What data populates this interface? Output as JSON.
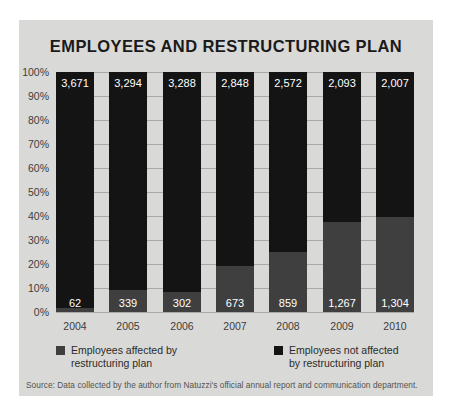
{
  "chart_data": {
    "type": "bar",
    "subtype": "stacked-percent",
    "title": "EMPLOYEES AND RESTRUCTURING PLAN",
    "xlabel": "",
    "ylabel": "",
    "ylim": [
      0,
      100
    ],
    "grid": true,
    "legend_position": "bottom",
    "categories": [
      "2004",
      "2005",
      "2006",
      "2007",
      "2008",
      "2009",
      "2010"
    ],
    "ytick_labels": [
      "100%",
      "90%",
      "80%",
      "70%",
      "60%",
      "50%",
      "40%",
      "30%",
      "20%",
      "10%",
      "0%"
    ],
    "ytick_values": [
      100,
      90,
      80,
      70,
      60,
      50,
      40,
      30,
      20,
      10,
      0
    ],
    "series": [
      {
        "name": "Employees not affected by restructuring plan",
        "color": "#141414",
        "values": [
          3671,
          3294,
          3288,
          2848,
          2572,
          2093,
          2007
        ],
        "labels": [
          "3,671",
          "3,294",
          "3,288",
          "2,848",
          "2,572",
          "2,093",
          "2,007"
        ],
        "percents": [
          98.3,
          90.7,
          91.6,
          80.9,
          75.0,
          62.3,
          60.6
        ]
      },
      {
        "name": "Employees affected by restructuring plan",
        "color": "#3f3f3f",
        "values": [
          62,
          339,
          302,
          673,
          859,
          1267,
          1304
        ],
        "labels": [
          "62",
          "339",
          "302",
          "673",
          "859",
          "1,267",
          "1,304"
        ],
        "percents": [
          1.7,
          9.3,
          8.4,
          19.1,
          25.0,
          37.7,
          39.4
        ]
      }
    ],
    "annotations": []
  },
  "legend": {
    "items": [
      {
        "label": "Employees affected by restructuring plan",
        "color": "#3f3f3f"
      },
      {
        "label": "Employees not affected by restructuring plan",
        "color": "#141414"
      }
    ]
  },
  "source": {
    "text": "Source: Data collected by the author from Natuzzi's official annual report and communication department."
  },
  "colors": {
    "panel_background": "#d9d9d7",
    "gridline": "#a9a9a6",
    "segment_not_affected": "#141414",
    "segment_affected": "#3f3f3f",
    "title_text": "#1a1a1a",
    "axis_text": "#3d3d3d"
  }
}
